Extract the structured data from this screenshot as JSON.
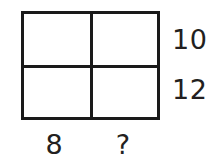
{
  "diagram": {
    "type": "area-model-rectangle",
    "title": "",
    "grid": {
      "rows": 2,
      "columns": 2,
      "cells": [
        {
          "id": "top-left",
          "label": ""
        },
        {
          "id": "top-right",
          "label": ""
        },
        {
          "id": "bottom-left",
          "label": ""
        },
        {
          "id": "bottom-right",
          "label": ""
        }
      ]
    },
    "labels": {
      "right_side": [
        {
          "position": "top-row",
          "text": "10"
        },
        {
          "position": "bottom-row",
          "text": "12"
        }
      ],
      "bottom_side": [
        {
          "position": "left-column",
          "text": "8"
        },
        {
          "position": "right-column",
          "text": "?"
        }
      ]
    },
    "colors": {
      "stroke": "#1a1a1a",
      "text": "#231f20",
      "background": "#ffffff",
      "cell_fill": "#ffffff"
    }
  }
}
